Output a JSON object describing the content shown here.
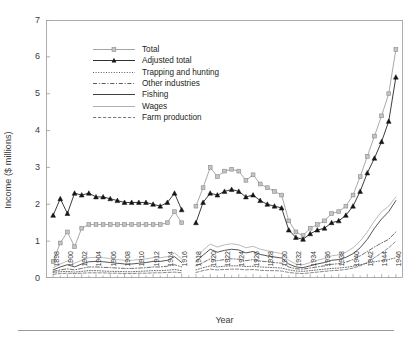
{
  "axes": {
    "ylabel": "Income ($ millions)",
    "xlabel": "Year",
    "yticks": [
      "0",
      "1",
      "2",
      "3",
      "4",
      "5",
      "6",
      "7"
    ],
    "xticks": [
      "1898",
      "1900",
      "1902",
      "1904",
      "1906",
      "1908",
      "1910",
      "1912",
      "1914",
      "1916",
      "1918",
      "1920",
      "1922",
      "1924",
      "1926",
      "1928",
      "1930",
      "1932",
      "1934",
      "1936",
      "1938",
      "1940",
      "1942",
      "1944",
      "1946"
    ]
  },
  "legend": {
    "items": [
      {
        "label": "Total",
        "key": "total",
        "style": "line-marker-square",
        "color": "#9a9a9a"
      },
      {
        "label": "Adjusted total",
        "key": "adjusted_total",
        "style": "line-marker-triangle",
        "color": "#1a1a1a"
      },
      {
        "label": "Trapping and hunting",
        "key": "trapping_and_hunting",
        "style": "dotted",
        "color": "#4a4a4a"
      },
      {
        "label": "Other industries",
        "key": "other_industries",
        "style": "dash-dot",
        "color": "#4a4a4a"
      },
      {
        "label": "Fishing",
        "key": "fishing",
        "style": "solid",
        "color": "#2b2b2b"
      },
      {
        "label": "Wages",
        "key": "wages",
        "style": "solid-light",
        "color": "#a8a8a8"
      },
      {
        "label": "Farm production",
        "key": "farm_production",
        "style": "dashed",
        "color": "#6b6b6b"
      }
    ]
  },
  "colors": {
    "axis": "#9a9a9a",
    "total": "#9a9a9a",
    "adjusted_total": "#1a1a1a",
    "trapping_and_hunting": "#4a4a4a",
    "other_industries": "#4a4a4a",
    "fishing": "#2b2b2b",
    "wages": "#a8a8a8",
    "farm_production": "#6b6b6b",
    "background": "#ffffff",
    "text": "#231f20"
  },
  "chart_data": {
    "type": "line",
    "title": "",
    "xlabel": "Year",
    "ylabel": "Income ($ millions)",
    "xlim": [
      1897,
      1947
    ],
    "ylim": [
      0,
      7
    ],
    "ytick_step": 1,
    "grid": false,
    "legend_position": "upper-left-inside",
    "note": "Data is split into three segments with gaps (no data 1917, and 1917-1918 break).",
    "x": [
      1898,
      1899,
      1900,
      1901,
      1902,
      1903,
      1904,
      1905,
      1906,
      1907,
      1908,
      1909,
      1910,
      1911,
      1912,
      1913,
      1914,
      1915,
      1916,
      1918,
      1919,
      1920,
      1921,
      1922,
      1923,
      1924,
      1925,
      1926,
      1927,
      1928,
      1929,
      1930,
      1931,
      1932,
      1933,
      1934,
      1935,
      1936,
      1937,
      1938,
      1939,
      1940,
      1941,
      1942,
      1943,
      1944,
      1945,
      1946
    ],
    "series": [
      {
        "name": "Total",
        "key": "total",
        "marker": "square",
        "values": [
          0.45,
          0.95,
          1.25,
          0.85,
          1.35,
          1.45,
          1.45,
          1.45,
          1.45,
          1.45,
          1.45,
          1.45,
          1.45,
          1.45,
          1.45,
          1.45,
          1.5,
          1.8,
          1.5,
          1.95,
          2.45,
          3.0,
          2.75,
          2.9,
          2.95,
          2.9,
          2.65,
          2.8,
          2.55,
          2.45,
          2.35,
          2.25,
          1.55,
          1.25,
          1.15,
          1.35,
          1.45,
          1.55,
          1.75,
          1.8,
          1.95,
          2.25,
          2.75,
          3.3,
          3.85,
          4.4,
          5.0,
          6.2
        ]
      },
      {
        "name": "Adjusted total",
        "key": "adjusted_total",
        "marker": "triangle",
        "values": [
          1.7,
          2.15,
          1.75,
          2.3,
          2.25,
          2.3,
          2.2,
          2.2,
          2.15,
          2.1,
          2.05,
          2.05,
          2.05,
          2.05,
          2.0,
          1.95,
          2.05,
          2.3,
          1.85,
          1.5,
          2.05,
          2.3,
          2.25,
          2.35,
          2.4,
          2.35,
          2.2,
          2.25,
          2.1,
          2.0,
          1.95,
          1.9,
          1.3,
          1.1,
          1.05,
          1.2,
          1.3,
          1.35,
          1.5,
          1.55,
          1.7,
          1.95,
          2.35,
          2.85,
          3.25,
          3.7,
          4.25,
          5.45
        ]
      },
      {
        "name": "Trapping and hunting",
        "key": "trapping_and_hunting",
        "style": "dotted",
        "values": [
          0.15,
          0.17,
          0.18,
          0.16,
          0.18,
          0.2,
          0.2,
          0.19,
          0.18,
          0.18,
          0.17,
          0.17,
          0.18,
          0.19,
          0.2,
          0.2,
          0.21,
          0.23,
          0.2,
          0.22,
          0.28,
          0.33,
          0.3,
          0.32,
          0.33,
          0.33,
          0.31,
          0.32,
          0.3,
          0.29,
          0.28,
          0.27,
          0.22,
          0.19,
          0.18,
          0.2,
          0.22,
          0.24,
          0.26,
          0.27,
          0.29,
          0.32,
          0.36,
          0.4,
          0.44,
          0.47,
          0.5,
          0.55
        ]
      },
      {
        "name": "Other industries",
        "key": "other_industries",
        "style": "dash-dot",
        "values": [
          0.18,
          0.22,
          0.25,
          0.22,
          0.26,
          0.3,
          0.3,
          0.29,
          0.28,
          0.27,
          0.26,
          0.26,
          0.27,
          0.28,
          0.3,
          0.3,
          0.32,
          0.36,
          0.3,
          0.33,
          0.42,
          0.52,
          0.47,
          0.5,
          0.52,
          0.51,
          0.47,
          0.5,
          0.46,
          0.44,
          0.42,
          0.4,
          0.3,
          0.25,
          0.24,
          0.27,
          0.3,
          0.33,
          0.37,
          0.39,
          0.43,
          0.5,
          0.6,
          0.72,
          0.84,
          0.95,
          1.05,
          1.25
        ]
      },
      {
        "name": "Fishing",
        "key": "fishing",
        "style": "solid",
        "values": [
          0.22,
          0.3,
          0.36,
          0.3,
          0.38,
          0.44,
          0.45,
          0.44,
          0.42,
          0.4,
          0.38,
          0.38,
          0.4,
          0.42,
          0.45,
          0.45,
          0.48,
          0.58,
          0.42,
          0.45,
          0.62,
          0.78,
          0.7,
          0.75,
          0.78,
          0.76,
          0.68,
          0.72,
          0.64,
          0.6,
          0.57,
          0.54,
          0.38,
          0.3,
          0.28,
          0.33,
          0.38,
          0.42,
          0.48,
          0.5,
          0.56,
          0.66,
          0.82,
          1.05,
          1.35,
          1.6,
          1.8,
          2.1
        ]
      },
      {
        "name": "Wages",
        "key": "wages",
        "style": "solid-light",
        "values": [
          0.28,
          0.38,
          0.46,
          0.4,
          0.48,
          0.55,
          0.56,
          0.55,
          0.53,
          0.5,
          0.48,
          0.48,
          0.5,
          0.52,
          0.55,
          0.55,
          0.58,
          0.68,
          0.52,
          0.55,
          0.75,
          0.92,
          0.84,
          0.9,
          0.93,
          0.9,
          0.82,
          0.86,
          0.78,
          0.74,
          0.7,
          0.66,
          0.48,
          0.38,
          0.36,
          0.42,
          0.48,
          0.53,
          0.6,
          0.63,
          0.7,
          0.82,
          1.0,
          1.25,
          1.55,
          1.8,
          1.95,
          2.2
        ]
      },
      {
        "name": "Farm production",
        "key": "farm_production",
        "style": "dashed",
        "values": [
          0.1,
          0.12,
          0.13,
          0.12,
          0.13,
          0.14,
          0.14,
          0.14,
          0.13,
          0.13,
          0.12,
          0.12,
          0.13,
          0.13,
          0.14,
          0.14,
          0.15,
          0.16,
          0.14,
          0.15,
          0.2,
          0.24,
          0.22,
          0.23,
          0.24,
          0.24,
          0.22,
          0.23,
          0.21,
          0.2,
          0.2,
          0.19,
          0.15,
          0.13,
          0.12,
          0.14,
          0.16,
          0.18,
          0.2,
          0.21,
          0.23,
          0.27,
          0.33,
          0.42,
          0.55,
          0.68,
          0.82,
          1.0
        ]
      }
    ]
  }
}
